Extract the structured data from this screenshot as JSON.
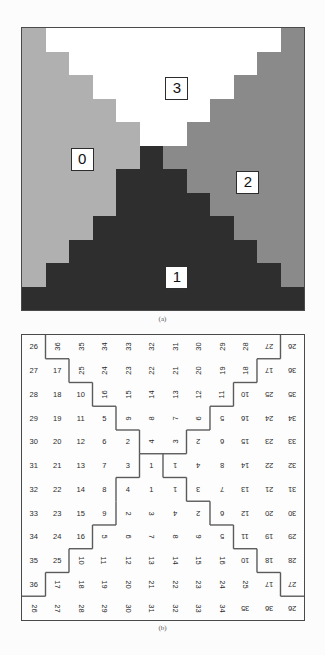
{
  "figure": {
    "panel_a": {
      "caption": "(a)",
      "region_labels": [
        {
          "text": "0",
          "col": 2,
          "row": 5
        },
        {
          "text": "3",
          "col": 6,
          "row": 2
        },
        {
          "text": "2",
          "col": 9,
          "row": 6
        },
        {
          "text": "1",
          "col": 6,
          "row": 10
        }
      ],
      "colors": {
        "region0": "#b0b0b0",
        "region1": "#2e2e2e",
        "region2": "#8a8a8a",
        "region3": "#ffffff",
        "border": "#4a4a4a"
      },
      "grid_size": 12,
      "region_map": [
        [
          0,
          3,
          3,
          3,
          3,
          3,
          3,
          3,
          3,
          3,
          3,
          2
        ],
        [
          0,
          0,
          3,
          3,
          3,
          3,
          3,
          3,
          3,
          3,
          2,
          2
        ],
        [
          0,
          0,
          0,
          3,
          3,
          3,
          3,
          3,
          3,
          2,
          2,
          2
        ],
        [
          0,
          0,
          0,
          0,
          3,
          3,
          3,
          3,
          2,
          2,
          2,
          2
        ],
        [
          0,
          0,
          0,
          0,
          0,
          3,
          3,
          2,
          2,
          2,
          2,
          2
        ],
        [
          0,
          0,
          0,
          0,
          0,
          1,
          2,
          2,
          2,
          2,
          2,
          2
        ],
        [
          0,
          0,
          0,
          0,
          1,
          1,
          1,
          2,
          2,
          2,
          2,
          2
        ],
        [
          0,
          0,
          0,
          0,
          1,
          1,
          1,
          1,
          2,
          2,
          2,
          2
        ],
        [
          0,
          0,
          0,
          1,
          1,
          1,
          1,
          1,
          1,
          2,
          2,
          2
        ],
        [
          0,
          0,
          1,
          1,
          1,
          1,
          1,
          1,
          1,
          1,
          2,
          2
        ],
        [
          0,
          1,
          1,
          1,
          1,
          1,
          1,
          1,
          1,
          1,
          1,
          2
        ],
        [
          1,
          1,
          1,
          1,
          1,
          1,
          1,
          1,
          1,
          1,
          1,
          1
        ]
      ]
    },
    "panel_b": {
      "caption": "(b)",
      "grid_size": 12,
      "values": [
        [
          26,
          36,
          35,
          34,
          33,
          32,
          31,
          30,
          29,
          28,
          27,
          26
        ],
        [
          27,
          17,
          25,
          24,
          23,
          22,
          21,
          20,
          19,
          18,
          17,
          36
        ],
        [
          28,
          18,
          10,
          16,
          15,
          14,
          13,
          12,
          11,
          10,
          25,
          35
        ],
        [
          29,
          19,
          11,
          5,
          9,
          8,
          7,
          6,
          5,
          16,
          24,
          34
        ],
        [
          30,
          20,
          12,
          6,
          2,
          4,
          3,
          2,
          6,
          15,
          23,
          33
        ],
        [
          31,
          21,
          13,
          7,
          3,
          1,
          1,
          4,
          8,
          14,
          22,
          32
        ],
        [
          32,
          22,
          14,
          8,
          4,
          1,
          1,
          3,
          7,
          13,
          21,
          31
        ],
        [
          33,
          23,
          15,
          9,
          2,
          3,
          4,
          2,
          6,
          12,
          20,
          30
        ],
        [
          34,
          24,
          16,
          5,
          6,
          7,
          8,
          9,
          5,
          11,
          19,
          29
        ],
        [
          35,
          25,
          10,
          11,
          12,
          13,
          14,
          15,
          16,
          10,
          18,
          28
        ],
        [
          36,
          17,
          18,
          19,
          20,
          21,
          22,
          23,
          24,
          25,
          17,
          27
        ],
        [
          26,
          27,
          28,
          29,
          30,
          31,
          32,
          33,
          34,
          35,
          36,
          26
        ]
      ],
      "rotations": [
        [
          0,
          270,
          270,
          270,
          270,
          270,
          270,
          270,
          270,
          270,
          180,
          180
        ],
        [
          0,
          0,
          270,
          270,
          270,
          270,
          270,
          270,
          270,
          270,
          180,
          180
        ],
        [
          0,
          0,
          0,
          270,
          270,
          270,
          270,
          270,
          270,
          180,
          180,
          180
        ],
        [
          0,
          0,
          0,
          0,
          270,
          270,
          270,
          270,
          180,
          180,
          180,
          180
        ],
        [
          0,
          0,
          0,
          0,
          0,
          270,
          270,
          180,
          180,
          180,
          180,
          180
        ],
        [
          0,
          0,
          0,
          0,
          0,
          0,
          180,
          180,
          180,
          180,
          180,
          180
        ],
        [
          0,
          0,
          0,
          0,
          0,
          0,
          180,
          180,
          180,
          180,
          180,
          180
        ],
        [
          0,
          0,
          0,
          0,
          90,
          90,
          180,
          180,
          180,
          180,
          180,
          180
        ],
        [
          0,
          0,
          0,
          90,
          90,
          90,
          90,
          90,
          180,
          180,
          180,
          180
        ],
        [
          0,
          0,
          90,
          90,
          90,
          90,
          90,
          90,
          90,
          180,
          180,
          180
        ],
        [
          0,
          90,
          90,
          90,
          90,
          90,
          90,
          90,
          90,
          90,
          180,
          180
        ],
        [
          90,
          90,
          90,
          90,
          90,
          90,
          90,
          90,
          90,
          180,
          180,
          180
        ]
      ],
      "boundary_color": "#5a5a5a",
      "border": "#4a4a4a"
    }
  },
  "ghost_text": {
    "top": "                                                                                     "
  }
}
